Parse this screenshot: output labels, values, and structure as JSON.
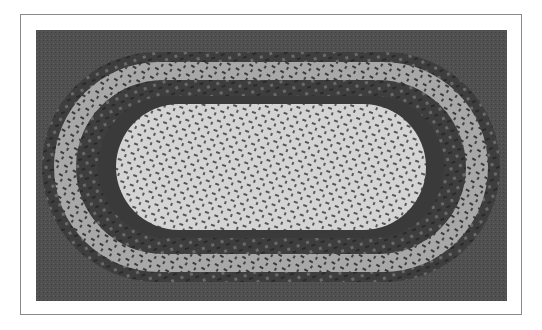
{
  "figure": {
    "colors": {
      "frame_border": "#8a8a8a",
      "floor": "#4a4a4a",
      "band_dark": "#3c3c3c",
      "band_mid": "#5e5e5e",
      "band_light": "#cfcfcf",
      "center_light": "#d8d8d8"
    }
  }
}
